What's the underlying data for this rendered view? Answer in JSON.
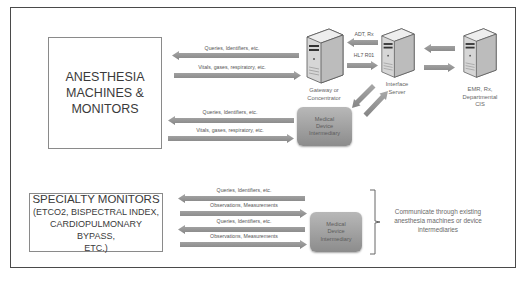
{
  "diagram": {
    "anesthesia_box": {
      "lines": [
        "ANESTHESIA",
        "MACHINES &",
        "MONITORS"
      ]
    },
    "specialty_box": {
      "title": "SPECIALTY MONITORS",
      "lines": [
        "(ETCO2, BISPECTRAL INDEX,",
        "CARDIOPULMONARY BYPASS,",
        "ETC.)"
      ]
    },
    "top_arrows": [
      {
        "label": "Queries, Identifiers, etc.",
        "direction": "left"
      },
      {
        "label": "Vitals, gases, respiratory, etc.",
        "direction": "right"
      }
    ],
    "middle_arrows": [
      {
        "label": "Queries, Identifiers, etc.",
        "direction": "left"
      },
      {
        "label": "Vitals, gases, respiratory, etc.",
        "direction": "right"
      }
    ],
    "bottom_arrows": [
      {
        "label": "Queries, Identifiers, etc.",
        "direction": "left"
      },
      {
        "label": "Observations, Measurements",
        "direction": "right"
      },
      {
        "label": "Queries, Identifiers, etc.",
        "direction": "left"
      },
      {
        "label": "Observations, Measurements",
        "direction": "right"
      }
    ],
    "servers": {
      "gateway": {
        "label_line1": "Gateway or",
        "label_line2": "Concentrator"
      },
      "interface": {
        "label_line1": "Interface",
        "label_line2": "Server"
      },
      "emr": {
        "label_line1": "EMR, Rx,",
        "label_line2": "Departmental",
        "label_line3": "CIS"
      }
    },
    "server_links": {
      "adt_label": "ADT, Rx",
      "hl7_label": "HL7 R01"
    },
    "intermediary_top": {
      "line1": "Medical",
      "line2": "Device",
      "line3": "Intermediary"
    },
    "intermediary_bottom": {
      "line1": "Medical",
      "line2": "Device",
      "line3": "Intermediary"
    },
    "note": "Communicate through existing anesthesia machines or device intermediaries",
    "colors": {
      "arrow_fill": "#9a9a9a",
      "arrow_dark": "#7e7e7e",
      "frame": "#4a4a4a",
      "text": "#3a3a3a"
    }
  }
}
